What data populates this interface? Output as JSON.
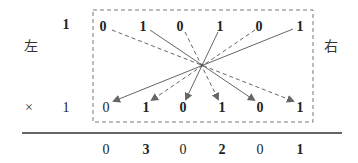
{
  "labels": {
    "left": "左",
    "right": "右",
    "times": "×",
    "multiplicand_prefix": "1",
    "multiplier_prefix": "1"
  },
  "top_row": [
    "0",
    "1",
    "0",
    "1",
    "0",
    "1"
  ],
  "bottom_row": [
    "0",
    "1",
    "0",
    "1",
    "0",
    "1"
  ],
  "result_row": [
    "0",
    "3",
    "0",
    "2",
    "0",
    "1"
  ],
  "connections": [
    {
      "from": 0,
      "to": 5,
      "style": "dashed"
    },
    {
      "from": 1,
      "to": 4,
      "style": "solid"
    },
    {
      "from": 2,
      "to": 3,
      "style": "dashed"
    },
    {
      "from": 3,
      "to": 2,
      "style": "solid"
    },
    {
      "from": 4,
      "to": 1,
      "style": "dashed"
    },
    {
      "from": 5,
      "to": 0,
      "style": "solid"
    }
  ],
  "colors": {
    "line": "#666666",
    "box": "#777777",
    "rule": "#333333"
  }
}
